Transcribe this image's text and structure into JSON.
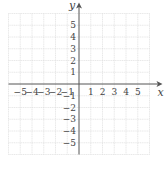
{
  "chart_data": {
    "type": "scatter",
    "title": "",
    "xlabel": "x",
    "ylabel": "y",
    "xlim": [
      -6,
      6
    ],
    "ylim": [
      -6,
      6
    ],
    "grid": true,
    "x_ticks": [
      -5,
      -4,
      -3,
      -2,
      -1,
      1,
      2,
      3,
      4,
      5
    ],
    "y_ticks": [
      -5,
      -4,
      -3,
      -2,
      -1,
      1,
      2,
      3,
      4,
      5
    ],
    "x_tick_labels": [
      "−5",
      "−4",
      "−3",
      "−2",
      "−1",
      "1",
      "2",
      "3",
      "4",
      "5"
    ],
    "y_tick_labels": [
      "−5",
      "−4",
      "−3",
      "−2",
      "−1",
      "1",
      "2",
      "3",
      "4",
      "5"
    ],
    "series": [],
    "legend": null
  },
  "layout": {
    "origin_px": [
      79,
      84
    ],
    "unit_px": 11.75,
    "grid_color": "#d8d8d8",
    "axis_color": "#555555"
  }
}
